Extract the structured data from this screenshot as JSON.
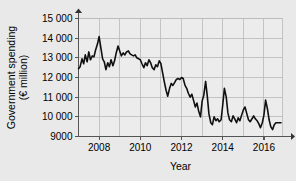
{
  "chart_data": {
    "type": "line",
    "title": "",
    "xlabel": "Year",
    "ylabel": "Government spending (€ million)",
    "ylabel_line1": "Government spending",
    "ylabel_line2": "(€ million)",
    "xlim": [
      2007.0,
      2016.9
    ],
    "ylim": [
      9000,
      15000
    ],
    "grid": true,
    "legend": "none",
    "line_color": "#101010",
    "background_color": "#e9e9e9",
    "plot_background_color": "#ececec",
    "gridline_color": "#b9b9b9",
    "axis_color": "#555555",
    "y_ticks": [
      9000,
      10000,
      11000,
      12000,
      13000,
      14000,
      15000
    ],
    "y_tick_labels": [
      "9000",
      "10 000",
      "11 000",
      "12 000",
      "13 000",
      "14 000",
      "15 000"
    ],
    "x_ticks": [
      2008,
      2010,
      2012,
      2014,
      2016
    ],
    "x_tick_labels": [
      "2008",
      "2010",
      "2012",
      "2014",
      "2016"
    ],
    "x_minor_gridlines": [
      2007,
      2008,
      2009,
      2010,
      2011,
      2012,
      2013,
      2014,
      2015,
      2016
    ],
    "x": [
      2007.0,
      2007.08,
      2007.17,
      2007.25,
      2007.33,
      2007.42,
      2007.5,
      2007.58,
      2007.67,
      2007.75,
      2007.83,
      2007.92,
      2008.0,
      2008.08,
      2008.17,
      2008.25,
      2008.33,
      2008.42,
      2008.5,
      2008.58,
      2008.67,
      2008.75,
      2008.83,
      2008.92,
      2009.0,
      2009.08,
      2009.17,
      2009.25,
      2009.33,
      2009.42,
      2009.5,
      2009.58,
      2009.67,
      2009.75,
      2009.83,
      2009.92,
      2010.0,
      2010.08,
      2010.17,
      2010.25,
      2010.33,
      2010.42,
      2010.5,
      2010.58,
      2010.67,
      2010.75,
      2010.83,
      2010.92,
      2011.0,
      2011.08,
      2011.17,
      2011.25,
      2011.33,
      2011.42,
      2011.5,
      2011.58,
      2011.67,
      2011.75,
      2011.83,
      2011.92,
      2012.0,
      2012.08,
      2012.17,
      2012.25,
      2012.33,
      2012.42,
      2012.5,
      2012.58,
      2012.67,
      2012.75,
      2012.83,
      2012.92,
      2013.0,
      2013.08,
      2013.17,
      2013.25,
      2013.33,
      2013.42,
      2013.5,
      2013.58,
      2013.67,
      2013.75,
      2013.83,
      2013.92,
      2014.0,
      2014.08,
      2014.17,
      2014.25,
      2014.33,
      2014.42,
      2014.5,
      2014.58,
      2014.67,
      2014.75,
      2014.83,
      2014.92,
      2015.0,
      2015.08,
      2015.17,
      2015.25,
      2015.33,
      2015.42,
      2015.5,
      2015.58,
      2015.67,
      2015.75,
      2015.83,
      2015.92,
      2016.0,
      2016.08,
      2016.17,
      2016.25,
      2016.33,
      2016.42,
      2016.5,
      2016.58,
      2016.67,
      2016.75,
      2016.83
    ],
    "values": [
      12450,
      12550,
      12950,
      12700,
      13150,
      12800,
      13300,
      12900,
      13100,
      13050,
      13400,
      13700,
      14080,
      13550,
      12950,
      12800,
      12400,
      12750,
      12550,
      12900,
      12600,
      12850,
      13250,
      13600,
      13350,
      13100,
      13250,
      13150,
      13300,
      13350,
      13200,
      13150,
      13100,
      13150,
      13000,
      12950,
      12900,
      12700,
      12500,
      12750,
      12600,
      12900,
      12750,
      12500,
      12400,
      12650,
      12550,
      12850,
      12700,
      12250,
      11750,
      11350,
      11050,
      11450,
      11700,
      11600,
      11750,
      11900,
      11950,
      11900,
      12000,
      11950,
      11600,
      11450,
      11200,
      11000,
      11150,
      10850,
      10500,
      10700,
      10300,
      10000,
      10800,
      11100,
      11800,
      11050,
      10150,
      9700,
      9600,
      10000,
      9800,
      9900,
      9750,
      9850,
      10600,
      11450,
      11000,
      10200,
      9850,
      9750,
      10050,
      9900,
      9700,
      9950,
      9800,
      10100,
      10350,
      10500,
      10150,
      9850,
      9750,
      9900,
      10050,
      9900,
      9800,
      9650,
      9450,
      9700,
      10100,
      10850,
      10400,
      9850,
      9500,
      9350,
      9600,
      9700,
      9700,
      9700,
      9700
    ]
  }
}
